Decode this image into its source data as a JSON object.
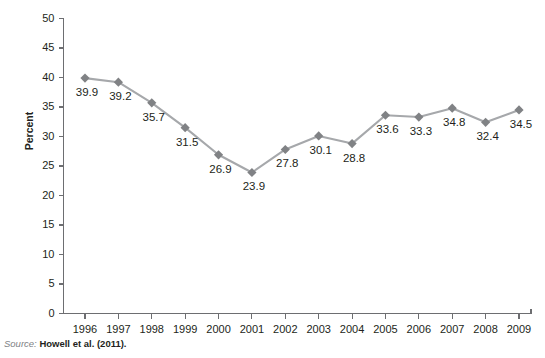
{
  "chart_data": {
    "type": "line",
    "title": "",
    "xlabel": "",
    "ylabel": "Percent",
    "categories": [
      "1996",
      "1997",
      "1998",
      "1999",
      "2000",
      "2001",
      "2002",
      "2003",
      "2004",
      "2005",
      "2006",
      "2007",
      "2008",
      "2009"
    ],
    "values": [
      39.9,
      39.2,
      35.7,
      31.5,
      26.9,
      23.9,
      27.8,
      30.1,
      28.8,
      33.6,
      33.3,
      34.8,
      32.4,
      34.5
    ],
    "point_labels": [
      "39.9",
      "39.2",
      "35.7",
      "31.5",
      "26.9",
      "23.9",
      "27.8",
      "30.1",
      "28.8",
      "33.6",
      "33.3",
      "34.8",
      "32.4",
      "34.5"
    ],
    "ylim": [
      0,
      50
    ],
    "yticks": [
      0,
      5,
      10,
      15,
      20,
      25,
      30,
      35,
      40,
      45,
      50
    ],
    "ytick_labels": [
      "0",
      "5",
      "10",
      "15",
      "20",
      "25",
      "30",
      "35",
      "40",
      "45",
      "50"
    ],
    "grid": false,
    "legend": false,
    "legend_position": "none",
    "series_color": "#a6a8ab",
    "marker_color": "#808285",
    "marker_shape": "diamond",
    "axis_color": "#6d6e71"
  },
  "footer": {
    "source_label": "Source:",
    "source_text": "Howell et al. (2011)."
  }
}
